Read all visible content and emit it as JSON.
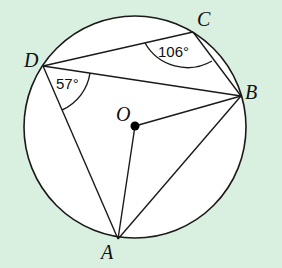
{
  "diagram": {
    "type": "geometry-circle-inscribed-quadrilateral",
    "background_color": "#d9efdf",
    "circle": {
      "center_label": "O",
      "cx": 135,
      "cy": 127,
      "r": 111,
      "fill": "#ffffff",
      "stroke": "#1a1a1a"
    },
    "points": {
      "A": {
        "label": "A",
        "x": 118,
        "y": 239
      },
      "B": {
        "label": "B",
        "x": 241,
        "y": 96
      },
      "C": {
        "label": "C",
        "x": 193,
        "y": 32
      },
      "D": {
        "label": "D",
        "x": 43,
        "y": 66
      },
      "O": {
        "label": "O",
        "x": 135,
        "y": 126
      }
    },
    "segments": [
      "D-C",
      "C-B",
      "D-B",
      "D-A",
      "A-B",
      "O-A",
      "O-B"
    ],
    "angles": {
      "BCD": {
        "label": "106°",
        "vertex": "C"
      },
      "ADB": {
        "label": "57°",
        "vertex": "D"
      }
    }
  }
}
